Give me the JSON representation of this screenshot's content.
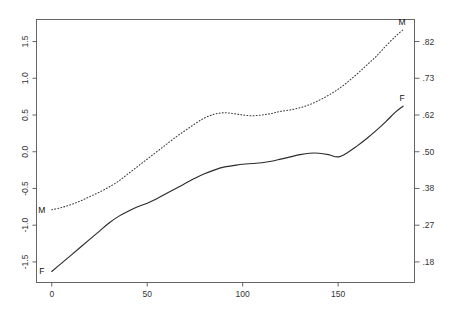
{
  "chart_data": {
    "type": "line",
    "title": "",
    "subtitle": "",
    "xlabel": "",
    "ylabel": "",
    "ylabel_right": "",
    "grid": false,
    "legend_position": "inline-end-labels",
    "xlim": [
      -8,
      190
    ],
    "ylim": [
      -1.78,
      1.8
    ],
    "x_ticks": [
      {
        "value": 0,
        "label": "0"
      },
      {
        "value": 50,
        "label": "50"
      },
      {
        "value": 100,
        "label": "100"
      },
      {
        "value": 150,
        "label": "150"
      }
    ],
    "y_ticks_left": [
      {
        "value": 1.5,
        "label": "1.5"
      },
      {
        "value": 1.0,
        "label": "1.0"
      },
      {
        "value": 0.5,
        "label": "0.5"
      },
      {
        "value": 0.0,
        "label": "0.0"
      },
      {
        "value": -0.5,
        "label": "-0.5"
      },
      {
        "value": -1.0,
        "label": "-1.0"
      },
      {
        "value": -1.5,
        "label": "-1.5"
      }
    ],
    "y_ticks_right": [
      {
        "value": 1.5,
        "label": ".82"
      },
      {
        "value": 1.0,
        "label": ".73"
      },
      {
        "value": 0.5,
        "label": ".62"
      },
      {
        "value": 0.0,
        "label": ".50"
      },
      {
        "value": -0.5,
        "label": ".38"
      },
      {
        "value": -1.0,
        "label": ".27"
      },
      {
        "value": -1.5,
        "label": ".18"
      }
    ],
    "series": [
      {
        "name": "M",
        "style": "dotted",
        "start_label": "M",
        "end_label": "M",
        "x": [
          0,
          5,
          10,
          15,
          20,
          25,
          30,
          35,
          40,
          45,
          50,
          55,
          60,
          65,
          70,
          75,
          80,
          85,
          90,
          95,
          100,
          105,
          110,
          115,
          120,
          125,
          130,
          135,
          140,
          145,
          150,
          155,
          160,
          165,
          170,
          175,
          180,
          184
        ],
        "values": [
          -0.79,
          -0.76,
          -0.72,
          -0.67,
          -0.61,
          -0.55,
          -0.48,
          -0.4,
          -0.3,
          -0.2,
          -0.1,
          0.0,
          0.1,
          0.2,
          0.29,
          0.38,
          0.46,
          0.51,
          0.53,
          0.52,
          0.5,
          0.49,
          0.5,
          0.52,
          0.55,
          0.57,
          0.6,
          0.64,
          0.7,
          0.77,
          0.85,
          0.95,
          1.06,
          1.18,
          1.3,
          1.44,
          1.57,
          1.66
        ]
      },
      {
        "name": "F",
        "style": "solid",
        "start_label": "F",
        "end_label": "F",
        "x": [
          0,
          5,
          10,
          15,
          20,
          25,
          30,
          35,
          40,
          45,
          50,
          55,
          60,
          65,
          70,
          75,
          80,
          85,
          90,
          95,
          100,
          105,
          110,
          115,
          120,
          125,
          130,
          135,
          140,
          145,
          150,
          155,
          160,
          165,
          170,
          175,
          180,
          184
        ],
        "values": [
          -1.63,
          -1.52,
          -1.41,
          -1.3,
          -1.19,
          -1.08,
          -0.97,
          -0.88,
          -0.81,
          -0.75,
          -0.7,
          -0.64,
          -0.57,
          -0.5,
          -0.43,
          -0.36,
          -0.3,
          -0.25,
          -0.21,
          -0.19,
          -0.17,
          -0.16,
          -0.15,
          -0.13,
          -0.1,
          -0.07,
          -0.04,
          -0.02,
          -0.02,
          -0.04,
          -0.07,
          -0.01,
          0.08,
          0.18,
          0.29,
          0.41,
          0.54,
          0.62
        ]
      }
    ]
  }
}
